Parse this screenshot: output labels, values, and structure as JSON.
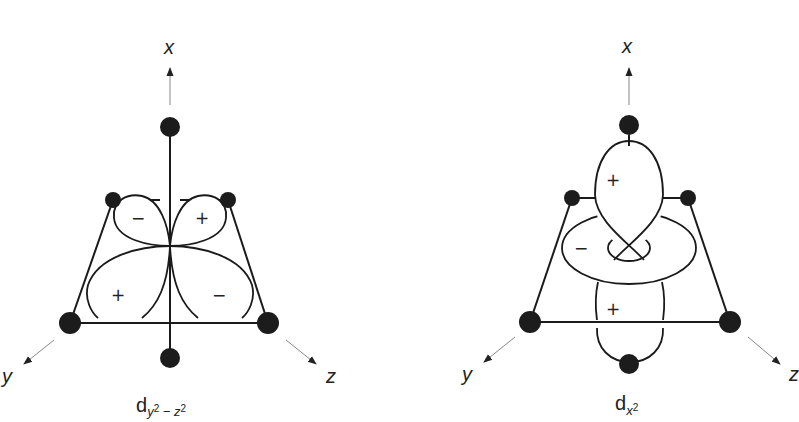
{
  "figures": [
    {
      "id": "left",
      "orbital": "d_{y2-z2}",
      "caption": {
        "base": "d",
        "sub1": "y",
        "sup1": "2",
        "minus": " − ",
        "sub2": "z",
        "sup2": "2"
      },
      "axes": {
        "x": "x",
        "y": "y",
        "z": "z"
      },
      "lobe_signs": {
        "upper_left": "−",
        "upper_right": "+",
        "lower_left": "+",
        "lower_right": "−"
      }
    },
    {
      "id": "right",
      "orbital": "d_{x2}",
      "caption": {
        "base": "d",
        "sub1": "x",
        "sup1": "2"
      },
      "axes": {
        "x": "x",
        "y": "y",
        "z": "z"
      },
      "lobe_signs": {
        "top_lobe": "+",
        "torus": "−",
        "bottom_lobe": "+"
      }
    }
  ],
  "colors": {
    "ink": "#1a1a1a",
    "ligand": "#1c1c1c",
    "axis_arrow": "#888888",
    "background": "#ffffff"
  }
}
